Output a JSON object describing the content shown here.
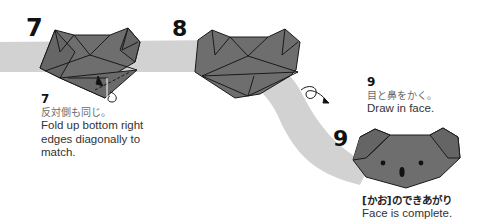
{
  "colors": {
    "band": "#d2d2d2",
    "paper": "#6e6e6e",
    "paper_dark": "#5f5f5f",
    "outline": "#1a1a1a",
    "text_dark": "#111111",
    "text_jp": "#6a6a6a"
  },
  "steps": [
    {
      "big_number": "7",
      "caption_number": "7",
      "caption_jp": "反対側も同じ。",
      "caption_en_lines": [
        "Fold up bottom right",
        "edges diagonally to",
        "match."
      ]
    },
    {
      "big_number": "8"
    },
    {
      "big_number": "9",
      "caption_number": "9",
      "caption_jp": "目と鼻をかく。",
      "caption_en": "Draw in face."
    }
  ],
  "final": {
    "caption_jp": "[かお]のできあがり",
    "caption_en": "Face is complete."
  },
  "icons": {
    "turn_over": "turn-over-arrow-icon",
    "fold_arrow": "fold-up-arrow-icon"
  }
}
